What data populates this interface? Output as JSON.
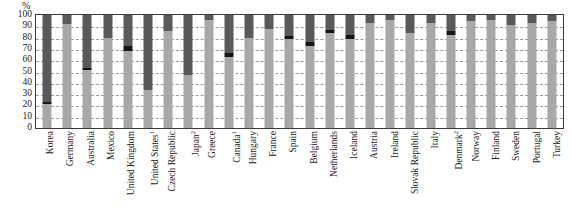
{
  "axis": {
    "unit_label": "%",
    "y_ticks": [
      "100",
      "90",
      "80",
      "70",
      "60",
      "50",
      "40",
      "30",
      "20",
      "10",
      "0"
    ]
  },
  "footnotes": {
    "one": "1",
    "two": "2"
  },
  "colors": {
    "low_segment": "#a8a8a8",
    "mid_segment": "#151515",
    "high_segment": "#595959",
    "gridline": "#9a9a9a",
    "frame": "#3a3a3a"
  },
  "chart_data": {
    "type": "bar",
    "title": "",
    "subtitle": "",
    "xlabel": "",
    "ylabel": "%",
    "ylim": [
      0,
      100
    ],
    "ytick_step": 10,
    "grid": true,
    "stacked": true,
    "legend": "none",
    "categories": [
      "Korea",
      "Germany",
      "Australia",
      "Mexico",
      "United Kingdom",
      "United States",
      "Czech Republic",
      "Japan",
      "Greece",
      "Canada",
      "Hungary",
      "France",
      "Spain",
      "Belgium",
      "Netherlands",
      "Iceland",
      "Austria",
      "Ireland",
      "Slovak Republic",
      "Italy",
      "Denmark",
      "Norway",
      "Finland",
      "Sweden",
      "Portugal",
      "Turkey"
    ],
    "category_labels": [
      "Korea",
      "Germany",
      "Australia",
      "Mexico",
      "United Kingdom",
      "United States1",
      "Czech Republic",
      "Japan2",
      "Greece",
      "Canada1",
      "Hungary",
      "France",
      "Spain",
      "Belgium",
      "Netherlands",
      "Iceland",
      "Austria",
      "Ireland",
      "Slovak Republic",
      "Italy",
      "Denmark2",
      "Norway",
      "Finland",
      "Sweden",
      "Portugal",
      "Turkey"
    ],
    "series": [
      {
        "name": "low",
        "values": [
          21,
          92,
          51,
          80,
          68,
          34,
          86,
          47,
          96,
          63,
          80,
          88,
          79,
          73,
          84,
          79,
          93,
          96,
          84,
          93,
          82,
          95,
          96,
          91,
          93,
          95
        ]
      },
      {
        "name": "mid",
        "values": [
          2,
          0,
          2,
          0,
          5,
          0,
          0,
          0,
          0,
          3,
          0,
          0,
          2,
          3,
          3,
          3,
          0,
          0,
          0,
          0,
          4,
          0,
          0,
          0,
          0,
          0
        ]
      },
      {
        "name": "high",
        "values": [
          77,
          8,
          47,
          20,
          27,
          66,
          14,
          53,
          4,
          34,
          20,
          12,
          19,
          24,
          13,
          18,
          7,
          4,
          16,
          7,
          14,
          5,
          4,
          9,
          7,
          5
        ]
      }
    ]
  }
}
